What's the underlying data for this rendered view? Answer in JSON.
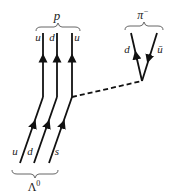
{
  "diagram": {
    "top_left_particle": "p",
    "top_right_particle": "π",
    "top_right_charge": "−",
    "bottom_particle": "Λ",
    "bottom_particle_superscript": "0",
    "proton_quarks": [
      "u",
      "d",
      "u"
    ],
    "lambda_quarks": [
      "u",
      "d",
      "s"
    ],
    "pion_quarks": [
      "d",
      "ū"
    ],
    "line_color": "#111111",
    "exchange": "dashed W line"
  }
}
